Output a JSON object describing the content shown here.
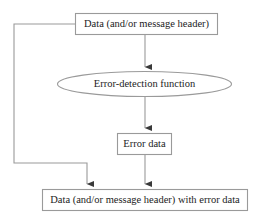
{
  "diagram": {
    "type": "flowchart",
    "background_color": "#ffffff",
    "line_color": "#9a9a9a",
    "text_color": "#1c1c1c",
    "nodes": [
      {
        "id": "source",
        "shape": "rectangle",
        "label": "Data (and/or message header)",
        "x": 75,
        "y": 13,
        "width": 143,
        "height": 22
      },
      {
        "id": "function",
        "shape": "ellipse",
        "label": "Error-detection function",
        "cx": 144.5,
        "cy": 84,
        "rx": 87.5,
        "ry": 12.5
      },
      {
        "id": "errordata",
        "shape": "rectangle",
        "label": "Error data",
        "x": 117,
        "y": 133,
        "width": 55,
        "height": 22
      },
      {
        "id": "output",
        "shape": "rectangle",
        "label": "Data (and/or message header) with error data",
        "x": 42,
        "y": 189,
        "width": 206,
        "height": 22
      }
    ],
    "edges": [
      {
        "id": "source-to-function",
        "from": "source",
        "to": "function",
        "arrowhead": true,
        "path": "M 145 35 L 145 71"
      },
      {
        "id": "function-to-errordata",
        "from": "function",
        "to": "errordata",
        "arrowhead": true,
        "path": "M 145 96 L 145 132"
      },
      {
        "id": "errordata-to-output",
        "from": "errordata",
        "to": "output",
        "arrowhead": true,
        "path": "M 145 155 L 145 188"
      },
      {
        "id": "source-to-output-feedback",
        "from": "source",
        "to": "output",
        "arrowhead": true,
        "path": "M 75 24 L 14 24 L 14 163 L 87 163 L 87 188"
      }
    ]
  }
}
